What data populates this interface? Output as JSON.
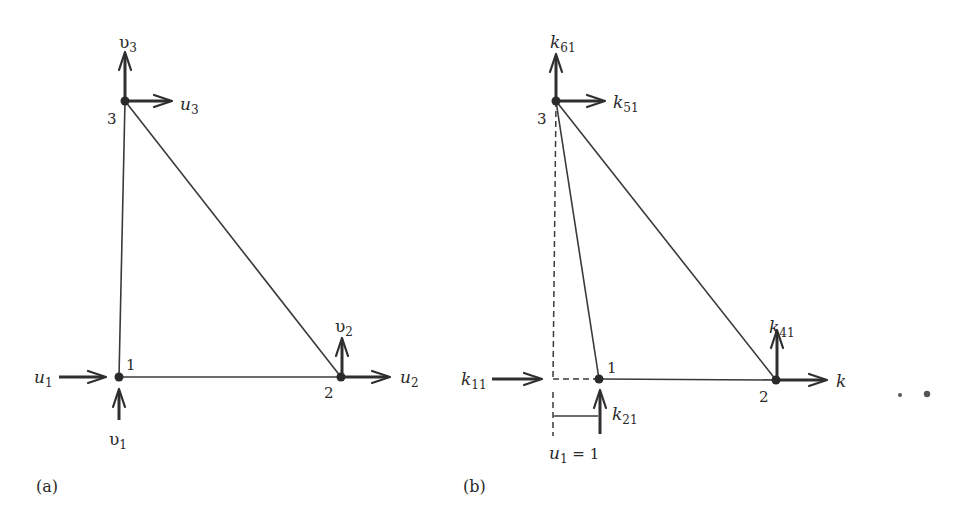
{
  "figure": {
    "panels": [
      {
        "id": "a",
        "caption": "(a)",
        "nodes": [
          {
            "id": "1",
            "label": "1"
          },
          {
            "id": "2",
            "label": "2"
          },
          {
            "id": "3",
            "label": "3"
          }
        ],
        "dofs": [
          {
            "name": "u",
            "sub": "1"
          },
          {
            "name": "υ",
            "sub": "1"
          },
          {
            "name": "u",
            "sub": "2"
          },
          {
            "name": "υ",
            "sub": "2"
          },
          {
            "name": "u",
            "sub": "3"
          },
          {
            "name": "υ",
            "sub": "3"
          }
        ]
      },
      {
        "id": "b",
        "caption": "(b)",
        "nodes": [
          {
            "id": "1",
            "label": "1"
          },
          {
            "id": "2",
            "label": "2"
          },
          {
            "id": "3",
            "label": "3"
          }
        ],
        "forces": [
          {
            "name": "k",
            "sub": "11"
          },
          {
            "name": "k",
            "sub": "21"
          },
          {
            "name": "k",
            "sub": "41"
          },
          {
            "name": "k",
            "sub": ""
          },
          {
            "name": "k",
            "sub": "51"
          },
          {
            "name": "k",
            "sub": "61"
          }
        ],
        "displacement": {
          "name": "u",
          "sub": "1",
          "eq": " = 1"
        }
      }
    ],
    "stray_marks": "* *"
  }
}
